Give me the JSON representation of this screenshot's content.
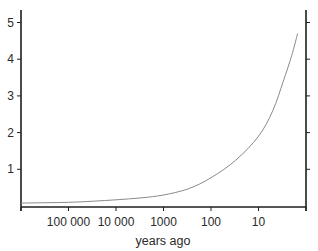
{
  "chart_data": {
    "type": "line",
    "title": "",
    "xlabel": "years ago",
    "ylabel": "",
    "x_scale": "log",
    "x_reversed": true,
    "xlim": [
      1000000,
      1
    ],
    "ylim": [
      0,
      5.3
    ],
    "x_ticks": [
      100000,
      10000,
      1000,
      100,
      10
    ],
    "x_tick_labels": [
      "100 000",
      "10 000",
      "1000",
      "100",
      "10"
    ],
    "y_ticks": [
      1,
      2,
      3,
      4,
      5
    ],
    "y_tick_labels": [
      "1",
      "2",
      "3",
      "4",
      "5"
    ],
    "grid": false,
    "legend": null,
    "series": [
      {
        "name": "curve",
        "color": "#8a8a8a",
        "x": [
          1000000,
          300000,
          100000,
          30000,
          10000,
          3000,
          1000,
          300,
          100,
          30,
          10,
          5,
          3,
          2,
          1.5
        ],
        "values": [
          0.08,
          0.09,
          0.1,
          0.13,
          0.17,
          0.22,
          0.3,
          0.47,
          0.77,
          1.25,
          1.9,
          2.6,
          3.4,
          4.1,
          4.7
        ]
      }
    ]
  },
  "axes": {
    "color": "#1e1e1e",
    "plot_left_px": 21,
    "plot_right_px": 306,
    "plot_top_px": 10,
    "x_axis_px": 207,
    "y_zero_px": 206,
    "y_unit_px": 36.7
  }
}
